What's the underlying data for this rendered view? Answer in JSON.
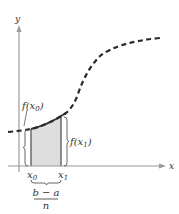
{
  "diagram": {
    "axes": {
      "x_label": "x",
      "y_label": "y",
      "axis_color": "#9a9a9a"
    },
    "curve": {
      "style": "dashed",
      "color": "#2a2a2a"
    },
    "shaded_region": {
      "fill": "#dedede",
      "edge_color": "#555555",
      "top_edge_color": "#333333"
    },
    "labels": {
      "f_x0": "f(x",
      "f_x0_sub": "0",
      "f_x1": "f(x",
      "f_x1_sub": "1",
      "close_paren": ")",
      "x0": "x",
      "x0_sub": "0",
      "x1": "x",
      "x1_sub": "1",
      "width_numerator": "b − a",
      "width_denominator": "n"
    }
  }
}
